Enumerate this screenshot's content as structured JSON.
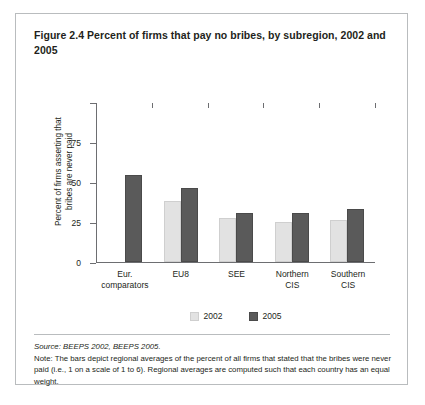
{
  "figure": {
    "title": "Figure 2.4  Percent of firms that pay no bribes, by subregion, 2002 and 2005",
    "source": "Source: BEEPS 2002, BEEPS 2005.",
    "note": "Note: The bars depict regional averages of the percent of all firms that stated that the bribes were never paid (i.e., 1 on a scale of 1 to 6). Regional averages are computed such that each country has an equal weight."
  },
  "legend": {
    "items": [
      {
        "label": "2002",
        "color": "#e2e2e2"
      },
      {
        "label": "2005",
        "color": "#5a5a5a"
      }
    ]
  },
  "axis": {
    "y_ticks": [
      "0",
      "25",
      "50",
      "75",
      "100"
    ],
    "y_title_line1": "Percent of firms asserting that",
    "y_title_line2": "bribes are never paid"
  },
  "categories": [
    {
      "line1": "Eur.",
      "line2": "comparators"
    },
    {
      "line1": "EU8",
      "line2": ""
    },
    {
      "line1": "SEE",
      "line2": ""
    },
    {
      "line1": "Northern",
      "line2": "CIS"
    },
    {
      "line1": "Southern",
      "line2": "CIS"
    }
  ],
  "chart_data": {
    "type": "bar",
    "title": "Percent of firms that pay no bribes, by subregion, 2002 and 2005",
    "xlabel": "",
    "ylabel": "Percent of firms asserting that bribes are never paid",
    "ylim": [
      0,
      100
    ],
    "yticks": [
      0,
      25,
      50,
      75,
      100
    ],
    "grid": false,
    "legend_position": "bottom-center",
    "categories": [
      "Eur. comparators",
      "EU8",
      "SEE",
      "Northern CIS",
      "Southern CIS"
    ],
    "series": [
      {
        "name": "2002",
        "color": "#e2e2e2",
        "values": [
          null,
          38,
          27,
          25,
          26
        ]
      },
      {
        "name": "2005",
        "color": "#5a5a5a",
        "values": [
          54,
          46,
          30.5,
          30.5,
          33
        ]
      }
    ]
  }
}
